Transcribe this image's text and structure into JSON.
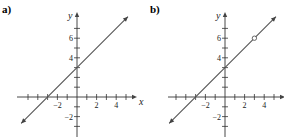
{
  "chart_data": [
    {
      "type": "line",
      "panel_label": "a)",
      "xlabel": "x",
      "ylabel": "y",
      "xlim": [
        -5,
        5
      ],
      "ylim": [
        -3,
        8
      ],
      "x_ticks": [
        -5,
        -4,
        -3,
        -2,
        -1,
        1,
        2,
        3,
        4,
        5
      ],
      "x_tick_labels": [
        {
          "v": -2,
          "t": "−2"
        },
        {
          "v": 2,
          "t": "2"
        },
        {
          "v": 4,
          "t": "4"
        }
      ],
      "y_ticks": [
        -3,
        -2,
        -1,
        1,
        2,
        3,
        4,
        5,
        6,
        7
      ],
      "y_tick_labels": [
        {
          "v": -2,
          "t": "−2"
        },
        {
          "v": 4,
          "t": "4"
        },
        {
          "v": 6,
          "t": "6"
        }
      ],
      "series": [
        {
          "name": "y = x + 3",
          "slope": 1,
          "intercept": 3,
          "x_range": [
            -5.7,
            5.2
          ],
          "arrows": "both"
        }
      ],
      "open_points": []
    },
    {
      "type": "line",
      "panel_label": "b)",
      "xlabel": "x",
      "ylabel": "y",
      "xlim": [
        -5,
        5
      ],
      "ylim": [
        -3,
        8
      ],
      "x_ticks": [
        -5,
        -4,
        -3,
        -2,
        -1,
        1,
        2,
        3,
        4,
        5
      ],
      "x_tick_labels": [
        {
          "v": -2,
          "t": "−2"
        },
        {
          "v": 2,
          "t": "2"
        },
        {
          "v": 4,
          "t": "4"
        }
      ],
      "y_ticks": [
        -3,
        -2,
        -1,
        1,
        2,
        3,
        4,
        5,
        6,
        7
      ],
      "y_tick_labels": [
        {
          "v": -2,
          "t": "−2"
        },
        {
          "v": 4,
          "t": "4"
        },
        {
          "v": 6,
          "t": "6"
        }
      ],
      "series": [
        {
          "name": "y = x + 3, x ≠ 3",
          "slope": 1,
          "intercept": 3,
          "x_range": [
            -5.7,
            5.2
          ],
          "arrows": "both"
        }
      ],
      "open_points": [
        {
          "x": 3,
          "y": 6
        }
      ]
    }
  ]
}
